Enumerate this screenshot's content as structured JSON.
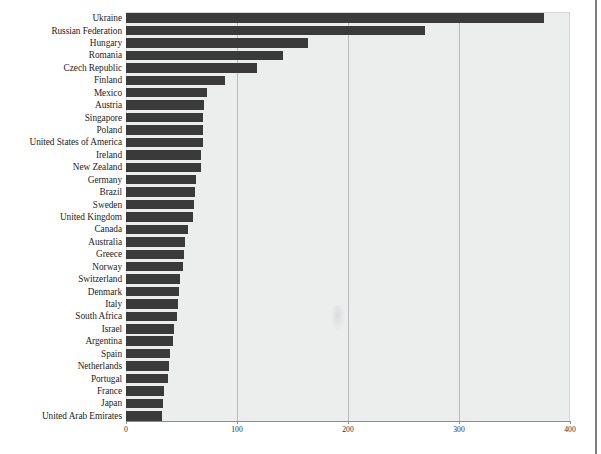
{
  "chart_data": {
    "type": "bar",
    "orientation": "horizontal",
    "title": "",
    "subtitle": "",
    "xlabel": "",
    "ylabel": "",
    "xlim": [
      0,
      400
    ],
    "ylim": null,
    "grid": true,
    "gridlines_x": [
      100,
      200,
      300
    ],
    "legend": null,
    "legend_position": "none",
    "xticks": [
      "0",
      "100",
      "200",
      "300",
      "400"
    ],
    "xtick_values": [
      0,
      100,
      200,
      300,
      400
    ],
    "bar_color": "#3a3a3a",
    "plot_background": "#eceded",
    "categories": [
      "Ukraine",
      "Russian Federation",
      "Hungary",
      "Romania",
      "Czech Republic",
      "Finland",
      "Mexico",
      "Austria",
      "Singapore",
      "Poland",
      "United States of America",
      "Ireland",
      "New Zealand",
      "Germany",
      "Brazil",
      "Sweden",
      "United Kingdom",
      "Canada",
      "Australia",
      "Greece",
      "Norway",
      "Switzerland",
      "Denmark",
      "Italy",
      "South Africa",
      "Israel",
      "Argentina",
      "Spain",
      "Netherlands",
      "Portugal",
      "France",
      "Japan",
      "United Arab Emirates"
    ],
    "values": [
      377,
      269,
      164,
      141,
      118,
      89,
      73,
      70,
      69,
      69,
      69,
      68,
      68,
      63,
      62,
      61,
      60,
      56,
      53,
      52,
      51,
      49,
      48,
      47,
      46,
      43,
      42,
      40,
      39,
      38,
      34,
      33,
      32
    ]
  },
  "watermark": {
    "name": "paper-smudge"
  }
}
